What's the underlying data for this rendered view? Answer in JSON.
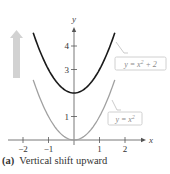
{
  "caption": {
    "label": "(a)",
    "text": "Vertical shift upward"
  },
  "axes": {
    "x_label": "x",
    "y_label": "y"
  },
  "colors": {
    "shifted": "#1a1a1a",
    "base": "#a0a0a0",
    "arrow": "#d0d0d0",
    "axis": "#555555"
  },
  "chart_data": {
    "type": "line",
    "xlabel": "x",
    "ylabel": "y",
    "xlim": [
      -2.3,
      2.5
    ],
    "ylim": [
      0,
      4.6
    ],
    "x_ticks": [
      -2,
      -1,
      1,
      2
    ],
    "y_ticks": [
      1,
      3,
      4
    ],
    "grid": false,
    "series": [
      {
        "name": "y = x^2 + 2",
        "label": "y = x² + 2",
        "formula": "x^2+2",
        "x": [
          -1.6,
          -1,
          0,
          1,
          1.6
        ],
        "values": [
          4.56,
          3,
          2,
          3,
          4.56
        ],
        "color": "#1a1a1a"
      },
      {
        "name": "y = x^2",
        "label": "y = x²",
        "formula": "x^2",
        "x": [
          -1.6,
          -1,
          0,
          1,
          1.6
        ],
        "values": [
          2.56,
          1,
          0,
          1,
          2.56
        ],
        "color": "#a0a0a0"
      }
    ],
    "annotations": [
      "upward arrow indicating vertical shift"
    ]
  }
}
